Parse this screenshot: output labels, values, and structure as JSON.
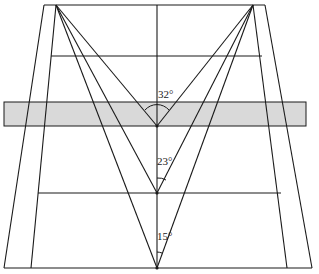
{
  "diagram": {
    "colors": {
      "line": "#1a1a1a",
      "band_fill": "#d9d9d9",
      "background": "#ffffff"
    },
    "angles": [
      {
        "label": "32°",
        "vertex": "upper",
        "value_deg": 32
      },
      {
        "label": "23°",
        "vertex": "middle",
        "value_deg": 23
      },
      {
        "label": "15°",
        "vertex": "lower",
        "value_deg": 15
      }
    ]
  }
}
